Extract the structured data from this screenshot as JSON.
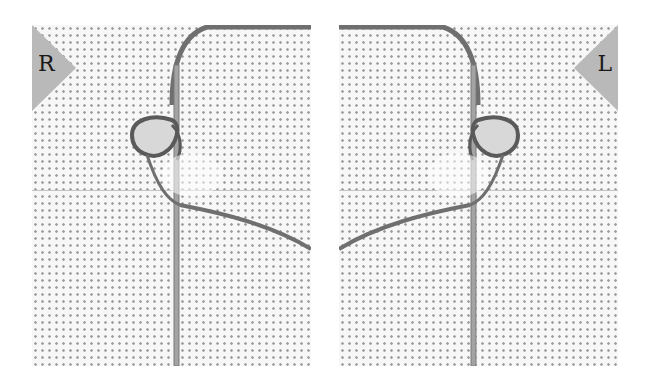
{
  "figure": {
    "panels": [
      {
        "id": "right-handed",
        "label": "R",
        "label_position": "top-left"
      },
      {
        "id": "left-handed",
        "label": "L",
        "label_position": "top-right"
      }
    ],
    "colors": {
      "fabric": "#f7f7f7",
      "fabric_holes": "#9a9a9a",
      "label_tab": "#b9b9b9",
      "label_text": "#1a1a1a",
      "thread": "#6f6f6f",
      "needle": "#9c9c9c"
    }
  }
}
